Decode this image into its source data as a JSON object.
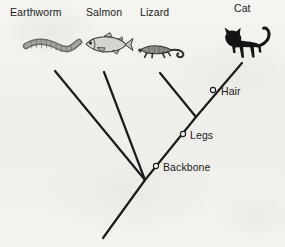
{
  "diagram": {
    "type": "cladogram",
    "background_color": "#f3f2ef",
    "line_color": "#1b1b1b",
    "taxa": [
      {
        "label": "Earthworm",
        "icon": "earthworm-illustration",
        "label_x": 10,
        "label_y": 6,
        "branch_tip_x": 55,
        "branch_tip_y": 71
      },
      {
        "label": "Salmon",
        "icon": "salmon-illustration",
        "label_x": 86,
        "label_y": 6,
        "branch_tip_x": 104,
        "branch_tip_y": 72
      },
      {
        "label": "Lizard",
        "icon": "lizard-illustration",
        "label_x": 140,
        "label_y": 6,
        "branch_tip_x": 160,
        "branch_tip_y": 73
      },
      {
        "label": "Cat",
        "icon": "cat-illustration",
        "label_x": 234,
        "label_y": 2,
        "branch_tip_x": 242,
        "branch_tip_y": 63
      }
    ],
    "nodes": [
      {
        "label": "Backbone",
        "marker": "open-circle",
        "marker_x": 156,
        "marker_y": 166,
        "label_x": 163,
        "label_y": 161
      },
      {
        "label": "Legs",
        "marker": "open-circle",
        "marker_x": 183,
        "marker_y": 134,
        "label_x": 190,
        "label_y": 129
      },
      {
        "label": "Hair",
        "marker": "open-circle",
        "marker_x": 213,
        "marker_y": 90,
        "label_x": 221,
        "label_y": 85
      }
    ],
    "root": {
      "stem_start_x": 145,
      "stem_start_y": 180,
      "stem_end_x": 103,
      "stem_end_y": 238
    }
  }
}
